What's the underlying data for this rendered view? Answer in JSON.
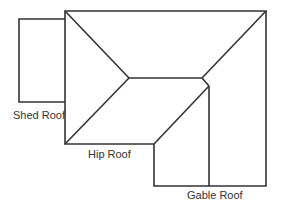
{
  "diagram": {
    "type": "roof-plan",
    "stroke_color": "#333333",
    "background": "#ffffff",
    "labels": {
      "shed": "Shed Roof",
      "hip": "Hip Roof",
      "gable": "Gable Roof"
    }
  }
}
